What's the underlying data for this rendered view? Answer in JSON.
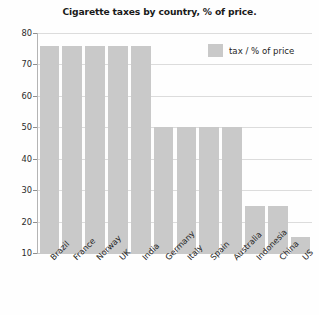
{
  "chart_data": {
    "type": "bar",
    "title": "Cigarette taxes by country, % of price.",
    "xlabel": "",
    "ylabel": "",
    "ylim": [
      10,
      80
    ],
    "yticks": [
      10,
      20,
      30,
      40,
      50,
      60,
      70,
      80
    ],
    "grid": true,
    "legend_position": "top-right",
    "categories": [
      "Brazil",
      "France",
      "Norway",
      "UK",
      "India",
      "Germany",
      "Italy",
      "Spain",
      "Australia",
      "Indonesia",
      "China",
      "US"
    ],
    "series": [
      {
        "name": "tax / % of price",
        "color": "#c9c9c9",
        "values": [
          76,
          76,
          76,
          76,
          76,
          50,
          50,
          50,
          50,
          25,
          25,
          15
        ]
      }
    ]
  },
  "legend": {
    "entries": [
      {
        "label": "tax / % of price",
        "color": "#c9c9c9"
      }
    ]
  },
  "colors": {
    "bar": "#c9c9c9",
    "grid": "#dcdcdc",
    "axis": "#b4b4b4",
    "text": "#231f20"
  }
}
